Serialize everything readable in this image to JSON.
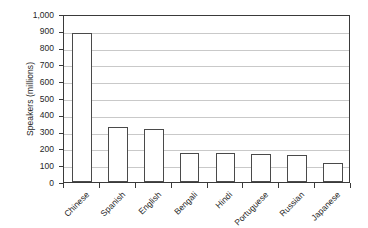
{
  "chart_data": {
    "type": "bar",
    "title": "",
    "subtitle": "",
    "xlabel": "",
    "ylabel": "Speakers (millions)",
    "categories": [
      "Chinese",
      "Spanish",
      "English",
      "Bengali",
      "Hindi",
      "Portuguese",
      "Russian",
      "Japanese"
    ],
    "values": [
      885,
      325,
      315,
      175,
      175,
      165,
      162,
      115
    ],
    "series": [
      {
        "name": "Speakers (millions)",
        "values": [
          885,
          325,
          315,
          175,
          175,
          165,
          162,
          115
        ]
      }
    ],
    "ylim": [
      0,
      1000
    ],
    "y_ticks": [
      0,
      100,
      200,
      300,
      400,
      500,
      600,
      700,
      800,
      900,
      1000
    ],
    "y_tick_labels": [
      "0",
      "100",
      "200",
      "300",
      "400",
      "500",
      "600",
      "700",
      "800",
      "900",
      "1,000"
    ],
    "grid": true,
    "grid_axis": "y",
    "legend": false,
    "legend_position": "none",
    "bar_fill_color": "#ffffff",
    "bar_border_color": "#4a4a4a",
    "gridline_color": "#c9c9c9",
    "axis_color": "#3a3a3a",
    "background_color": "#ffffff",
    "x_label_rotation": -45
  }
}
